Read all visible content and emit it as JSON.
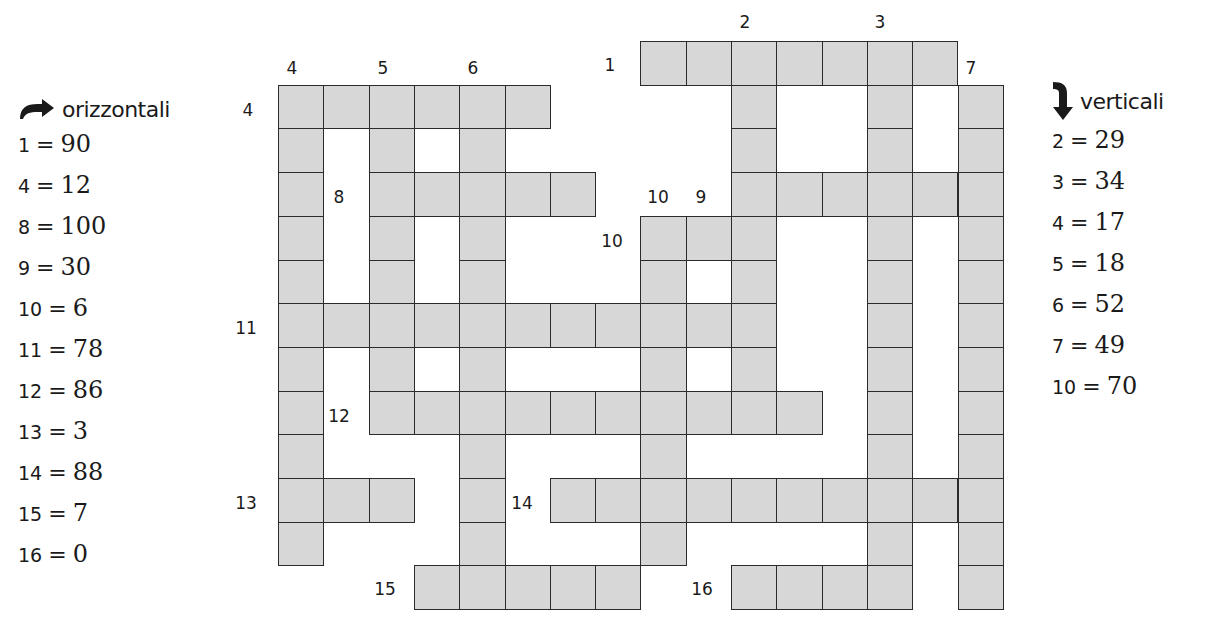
{
  "horizontal_panel": {
    "title": "orizzontali",
    "icon": "curved-right-arrow-icon",
    "clues": [
      {
        "num": "1",
        "eq": "=",
        "value": "90"
      },
      {
        "num": "4",
        "eq": "=",
        "value": "12"
      },
      {
        "num": "8",
        "eq": "=",
        "value": "100"
      },
      {
        "num": "9",
        "eq": "=",
        "value": "30"
      },
      {
        "num": "10",
        "eq": "=",
        "value": "6"
      },
      {
        "num": "11",
        "eq": "=",
        "value": "78"
      },
      {
        "num": "12",
        "eq": "=",
        "value": "86"
      },
      {
        "num": "13",
        "eq": "=",
        "value": "3"
      },
      {
        "num": "14",
        "eq": "=",
        "value": "88"
      },
      {
        "num": "15",
        "eq": "=",
        "value": "7"
      },
      {
        "num": "16",
        "eq": "=",
        "value": "0"
      }
    ]
  },
  "vertical_panel": {
    "title": "verticali",
    "icon": "curved-down-arrow-icon",
    "clues": [
      {
        "num": "2",
        "eq": "=",
        "value": "29"
      },
      {
        "num": "3",
        "eq": "=",
        "value": "34"
      },
      {
        "num": "4",
        "eq": "=",
        "value": "17"
      },
      {
        "num": "5",
        "eq": "=",
        "value": "18"
      },
      {
        "num": "6",
        "eq": "=",
        "value": "52"
      },
      {
        "num": "7",
        "eq": "=",
        "value": "49"
      },
      {
        "num": "10",
        "eq": "=",
        "value": "70"
      }
    ]
  },
  "crossword": {
    "cell_fill": "#d7d7d7",
    "border_color": "#2b2b2b",
    "origin": {
      "x": 278,
      "y": 41
    },
    "cell_w": 45.3,
    "cell_h": 43.7,
    "words": [
      {
        "label": "1",
        "dir": "across",
        "row": 0,
        "col": 8,
        "len": 7
      },
      {
        "label": "4",
        "dir": "across",
        "row": 1,
        "col": 0,
        "len": 6
      },
      {
        "label": "8",
        "dir": "across",
        "row": 3,
        "col": 2,
        "len": 5
      },
      {
        "label": "9",
        "dir": "across",
        "row": 3,
        "col": 10,
        "len": 6
      },
      {
        "label": "10",
        "dir": "across",
        "row": 4,
        "col": 8,
        "len": 3
      },
      {
        "label": "11",
        "dir": "across",
        "row": 6,
        "col": 0,
        "len": 11
      },
      {
        "label": "12",
        "dir": "across",
        "row": 8,
        "col": 2,
        "len": 10
      },
      {
        "label": "13",
        "dir": "across",
        "row": 10,
        "col": 0,
        "len": 3
      },
      {
        "label": "14",
        "dir": "across",
        "row": 10,
        "col": 6,
        "len": 10
      },
      {
        "label": "15",
        "dir": "across",
        "row": 12,
        "col": 3,
        "len": 5
      },
      {
        "label": "16",
        "dir": "across",
        "row": 12,
        "col": 10,
        "len": 4
      },
      {
        "label": "2",
        "dir": "down",
        "row": 0,
        "col": 10,
        "len": 9
      },
      {
        "label": "3",
        "dir": "down",
        "row": 0,
        "col": 13,
        "len": 13
      },
      {
        "label": "4",
        "dir": "down",
        "row": 1,
        "col": 0,
        "len": 11
      },
      {
        "label": "5",
        "dir": "down",
        "row": 1,
        "col": 2,
        "len": 8
      },
      {
        "label": "6",
        "dir": "down",
        "row": 1,
        "col": 4,
        "len": 12
      },
      {
        "label": "7",
        "dir": "down",
        "row": 1,
        "col": 15,
        "len": 12
      },
      {
        "label": "10",
        "dir": "down",
        "row": 4,
        "col": 8,
        "len": 8
      }
    ],
    "labels": [
      {
        "text": "1",
        "x": 603,
        "y": 55
      },
      {
        "text": "2",
        "x": 738,
        "y": 12
      },
      {
        "text": "3",
        "x": 873,
        "y": 12
      },
      {
        "text": "4",
        "x": 285,
        "y": 58
      },
      {
        "text": "5",
        "x": 376,
        "y": 58
      },
      {
        "text": "6",
        "x": 466,
        "y": 58
      },
      {
        "text": "7",
        "x": 964,
        "y": 58
      },
      {
        "text": "4",
        "x": 241,
        "y": 100
      },
      {
        "text": "8",
        "x": 332,
        "y": 187
      },
      {
        "text": "10",
        "x": 651,
        "y": 187
      },
      {
        "text": "9",
        "x": 694,
        "y": 187
      },
      {
        "text": "10",
        "x": 605,
        "y": 231
      },
      {
        "text": "11",
        "x": 239,
        "y": 318
      },
      {
        "text": "12",
        "x": 332,
        "y": 406
      },
      {
        "text": "13",
        "x": 239,
        "y": 493
      },
      {
        "text": "14",
        "x": 515,
        "y": 493
      },
      {
        "text": "15",
        "x": 378,
        "y": 579
      },
      {
        "text": "16",
        "x": 695,
        "y": 579
      }
    ]
  }
}
